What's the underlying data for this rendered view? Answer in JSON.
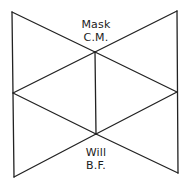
{
  "diagram": {
    "type": "geometric-figure",
    "stroke_color": "#222222",
    "background": "#ffffff",
    "vertices": {
      "top_left": [
        12,
        12
      ],
      "top_right": [
        177,
        11
      ],
      "bottom_left": [
        14,
        177
      ],
      "bottom_right": [
        178,
        173
      ],
      "mid_left": [
        13,
        93
      ],
      "mid_right": [
        177,
        92
      ],
      "center_top": [
        95,
        52
      ],
      "center_bottom": [
        96,
        134
      ]
    },
    "labels": {
      "top": {
        "line1": "Mask",
        "line2": "C.M."
      },
      "bottom": {
        "line1": "Will",
        "line2": "B.F."
      }
    }
  }
}
